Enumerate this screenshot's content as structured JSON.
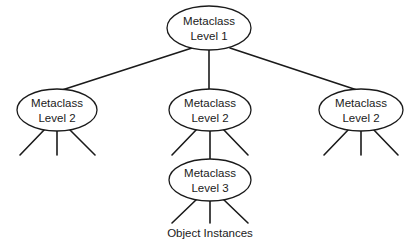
{
  "diagram": {
    "nodes": {
      "level1": {
        "line1": "Metaclass",
        "line2": "Level 1"
      },
      "level2_left": {
        "line1": "Metaclass",
        "line2": "Level 2"
      },
      "level2_middle": {
        "line1": "Metaclass",
        "line2": "Level 2"
      },
      "level2_right": {
        "line1": "Metaclass",
        "line2": "Level 2"
      },
      "level3": {
        "line1": "Metaclass",
        "line2": "Level 3"
      }
    },
    "leaf_caption": "Object Instances",
    "colors": {
      "stroke": "#1a1a1a",
      "background": "#ffffff",
      "text": "#1a1a1a"
    }
  }
}
